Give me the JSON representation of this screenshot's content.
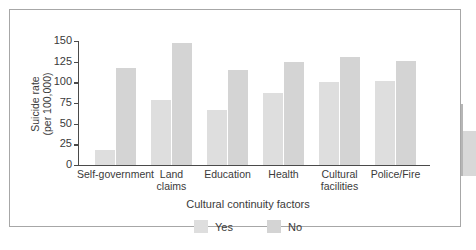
{
  "chart_data": {
    "type": "bar",
    "title": "",
    "subtitle": "",
    "xlabel": "Cultural continuity factors",
    "ylabel": "Suicide rate\n(per 100,000)",
    "categories": [
      "Self-government",
      "Land\nclaims",
      "Education",
      "Health",
      "Cultural\nfacilities",
      "Police/Fire"
    ],
    "series": [
      {
        "name": "Yes",
        "values": [
          18,
          79,
          66,
          87,
          101,
          102
        ],
        "color": "#dedede"
      },
      {
        "name": "No",
        "values": [
          117,
          148,
          115,
          125,
          131,
          126
        ],
        "color": "#d4d4d4"
      }
    ],
    "ylim": [
      0,
      150
    ],
    "yticks": [
      150,
      125,
      100,
      75,
      50,
      25,
      0
    ],
    "ytick_labels": [
      "150",
      "125",
      "100",
      "75",
      "50",
      "25",
      "0"
    ],
    "grid": false,
    "legend_position": "bottom"
  },
  "figure": {
    "frame_color": "#a7a7a7",
    "background": "#ffffff",
    "axis_color": "#4a4a4a"
  },
  "legend": {
    "items": [
      {
        "label": "Yes",
        "swatch": "#dedede"
      },
      {
        "label": "No",
        "swatch": "#d4d4d4"
      }
    ]
  }
}
